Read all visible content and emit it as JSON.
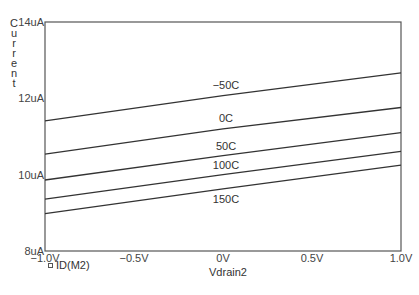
{
  "chart_data": {
    "type": "line",
    "title": "",
    "xlabel": "Vdrain2",
    "ylabel": "Current",
    "xlim": [
      -1.0,
      1.0
    ],
    "ylim": [
      8,
      14
    ],
    "y_unit": "uA",
    "x_unit": "V",
    "grid": false,
    "legend": [
      {
        "name": "ID(M2)",
        "marker": "square"
      }
    ],
    "legend_position": "bottom-left",
    "x_ticks": [
      "-1.0V",
      "-0.5V",
      "0V",
      "0.5V",
      "1.0V"
    ],
    "y_ticks": [
      "8uA",
      "10uA",
      "12uA",
      "14uA"
    ],
    "x": [
      -1.0,
      0.0,
      1.0
    ],
    "series": [
      {
        "name": "-50C",
        "values": [
          11.41,
          12.07,
          12.67
        ]
      },
      {
        "name": "0C",
        "values": [
          10.54,
          11.2,
          11.76
        ]
      },
      {
        "name": "50C",
        "values": [
          9.86,
          10.5,
          11.1
        ]
      },
      {
        "name": "100C",
        "values": [
          9.36,
          10.0,
          10.61
        ]
      },
      {
        "name": "150C",
        "values": [
          8.98,
          9.63,
          10.25
        ]
      }
    ],
    "annotations": [
      {
        "text": "-50C",
        "x": 0.0,
        "y": 12.35
      },
      {
        "text": "0C",
        "x": 0.0,
        "y": 11.48
      },
      {
        "text": "50C",
        "x": 0.0,
        "y": 10.75
      },
      {
        "text": "100C",
        "x": 0.0,
        "y": 10.25
      },
      {
        "text": "150C",
        "x": 0.0,
        "y": 9.35
      }
    ]
  },
  "colors": {
    "line": "#333333",
    "axis": "#555555",
    "background": "#ffffff"
  }
}
